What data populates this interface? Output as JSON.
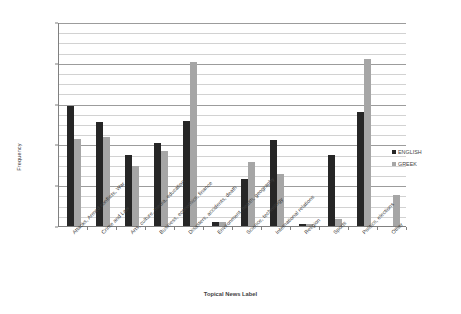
{
  "chart_data": {
    "type": "bar",
    "title": "",
    "xlabel": "Topical News Label",
    "ylabel": "Frequency",
    "ylim": [
      0,
      0.25
    ],
    "ytick_labels": [
      "0",
      "0.05",
      "0.1",
      "0.15",
      "0.2",
      "0.25"
    ],
    "ytick_values": [
      0,
      0.05,
      0.1,
      0.15,
      0.2,
      0.25
    ],
    "grid": true,
    "minor_grid_step": 0.0125,
    "legend_position": "right",
    "categories": [
      "Attacks, Armed conflicts, War",
      "Crime and Law",
      "Arts, culture, media, education",
      "Business, economics, finance",
      "Disasters, accidents, death",
      "Environment, health, geography",
      "Science, technology",
      "International relations",
      "Religion",
      "Sports",
      "Politics, elections",
      "Other"
    ],
    "series": [
      {
        "name": "ENGLISH",
        "color": "#262626",
        "values": [
          0.147,
          0.128,
          0.087,
          0.102,
          0.129,
          0.005,
          0.058,
          0.105,
          0.003,
          0.087,
          0.14,
          0.0
        ]
      },
      {
        "name": "GREEK",
        "color": "#a6a6a6",
        "values": [
          0.107,
          0.109,
          0.074,
          0.092,
          0.201,
          0.005,
          0.078,
          0.064,
          0.002,
          0.008,
          0.205,
          0.038
        ]
      }
    ]
  },
  "legend": {
    "items": [
      {
        "label": "ENGLISH",
        "swatch": "english-swatch-icon"
      },
      {
        "label": "GREEK",
        "swatch": "greek-swatch-icon"
      }
    ]
  },
  "axes": {
    "y_title": "Frequency",
    "x_title": "Topical News Label"
  }
}
